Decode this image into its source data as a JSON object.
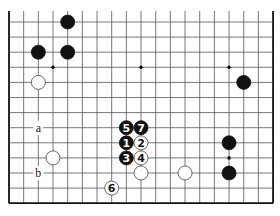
{
  "diagram": {
    "type": "go-board-fragment",
    "columns": 19,
    "rows": 13,
    "origin_x": 9,
    "origin_y": 22,
    "col_spacing": 14.67,
    "row_spacing": 15.1,
    "top_edge_open": true,
    "line_color": "#555555",
    "border_color": "#111111",
    "star_points": [
      {
        "col": 3,
        "row": 3
      },
      {
        "col": 9,
        "row": 3
      },
      {
        "col": 15,
        "row": 3
      },
      {
        "col": 15,
        "row": 9
      }
    ],
    "stones": [
      {
        "color": "black",
        "col": 4,
        "row": 0,
        "label": ""
      },
      {
        "color": "black",
        "col": 2,
        "row": 2,
        "label": ""
      },
      {
        "color": "black",
        "col": 4,
        "row": 2,
        "label": ""
      },
      {
        "color": "white",
        "col": 2,
        "row": 4,
        "label": ""
      },
      {
        "color": "black",
        "col": 16,
        "row": 4,
        "label": ""
      },
      {
        "color": "black",
        "col": 8,
        "row": 7,
        "label": "5"
      },
      {
        "color": "black",
        "col": 9,
        "row": 7,
        "label": "7"
      },
      {
        "color": "black",
        "col": 8,
        "row": 8,
        "label": "1"
      },
      {
        "color": "white",
        "col": 9,
        "row": 8,
        "label": "2"
      },
      {
        "color": "black",
        "col": 8,
        "row": 9,
        "label": "3"
      },
      {
        "color": "white",
        "col": 9,
        "row": 9,
        "label": "4"
      },
      {
        "color": "white",
        "col": 3,
        "row": 9,
        "label": ""
      },
      {
        "color": "white",
        "col": 9,
        "row": 10,
        "label": ""
      },
      {
        "color": "white",
        "col": 12,
        "row": 10,
        "label": ""
      },
      {
        "color": "black",
        "col": 15,
        "row": 8,
        "label": ""
      },
      {
        "color": "black",
        "col": 15,
        "row": 10,
        "label": ""
      },
      {
        "color": "white",
        "col": 7,
        "row": 11,
        "label": "6"
      }
    ],
    "markers": [
      {
        "col": 2,
        "row": 7,
        "label": "a"
      },
      {
        "col": 2,
        "row": 10,
        "label": "b"
      }
    ]
  }
}
